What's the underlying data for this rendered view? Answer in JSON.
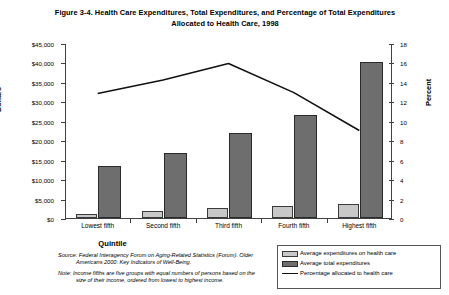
{
  "figure": {
    "title_line1": "Figure 3-4. Health Care Expenditures, Total Expenditures, and Percentage of Total",
    "title_line2": "Expenditures Allocated to Health Care, 1998"
  },
  "axes": {
    "ylabel": "Dollars",
    "rlabel": "Percent",
    "xlabel": "Quintile",
    "yticks": [
      "$0",
      "$5,000",
      "$10,000",
      "$15,000",
      "$20,000",
      "$25,000",
      "$30,000",
      "$35,000",
      "$40,000",
      "$45,000"
    ],
    "rticks": [
      "0",
      "2",
      "4",
      "6",
      "8",
      "10",
      "12",
      "14",
      "16",
      "18"
    ]
  },
  "legend": {
    "items": [
      {
        "label": "Average expenditures on health care",
        "swatch": "light"
      },
      {
        "label": "Average total expenditures",
        "swatch": "dark"
      },
      {
        "label": "Percentage allocated to health care",
        "swatch": "line"
      }
    ]
  },
  "source_note": {
    "source_prefix": "Source:",
    "source_text": "Federal Interagency Forum on Aging-Related Statistics (Forum). Older Americans 2000: Key Indicators of Well-Being.",
    "note_prefix": "Note:",
    "note_text": "Income fifths are five groups with equal numbers of persons based on the size of their income, ordered from lowest to highest income."
  },
  "colors": {
    "bar_light": "#c8c8c8",
    "bar_dark": "#6e6e6e",
    "line": "#111111",
    "axis": "#404040",
    "background": "#ffffff"
  },
  "chart_data": {
    "type": "bar",
    "title": "Figure 3-4. Health Care Expenditures, Total Expenditures, and Percentage of Total Expenditures Allocated to Health Care, 1998",
    "xlabel": "Quintile",
    "ylabel": "Dollars",
    "y2label": "Percent",
    "categories": [
      "Lowest fifth",
      "Second fifth",
      "Third fifth",
      "Fourth fifth",
      "Highest fifth"
    ],
    "ylim": [
      0,
      45000
    ],
    "ytick_step": 5000,
    "y2lim": [
      0,
      18
    ],
    "y2tick_step": 2,
    "grid": false,
    "legend_position": "bottom-right",
    "series": [
      {
        "name": "Average expenditures on health care",
        "type": "bar",
        "axis": "left",
        "color": "#c8c8c8",
        "values": [
          1000,
          1800,
          2600,
          3100,
          3600
        ]
      },
      {
        "name": "Average total expenditures",
        "type": "bar",
        "axis": "left",
        "color": "#6e6e6e",
        "values": [
          13300,
          16700,
          21800,
          26400,
          40000
        ]
      },
      {
        "name": "Percentage allocated to health care",
        "type": "line",
        "axis": "right",
        "color": "#111111",
        "values": [
          12.9,
          14.3,
          16.0,
          13.0,
          9.1
        ]
      }
    ]
  }
}
